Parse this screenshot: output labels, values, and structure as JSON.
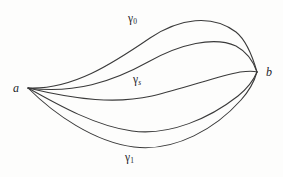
{
  "figure": {
    "kind": "homotopy-of-paths-diagram",
    "width": 283,
    "height": 177,
    "background_color": "#fdfdfc",
    "stroke_color": "#3a3a3a",
    "text_color": "#24242a"
  },
  "vertices": [
    {
      "id": "a",
      "label": "a",
      "x": 28,
      "y": 88
    },
    {
      "id": "b",
      "label": "b",
      "x": 257,
      "y": 72
    }
  ],
  "curve_labels": [
    {
      "id": "gamma-0",
      "symbol": "γ",
      "subscript": "0",
      "subscript_italic": false,
      "x": 128,
      "y": 13
    },
    {
      "id": "gamma-s",
      "symbol": "γ",
      "subscript": "s",
      "subscript_italic": true,
      "x": 133,
      "y": 74
    },
    {
      "id": "gamma-1",
      "symbol": "γ",
      "subscript": "1",
      "subscript_italic": false,
      "x": 125,
      "y": 152
    }
  ],
  "curves": [
    {
      "id": "curve-gamma-0",
      "name": "gamma-0",
      "path": "M 28 88 C 72 90 112 64 150 38 C 180 18 212 14 236 32 C 246 40 253 58 257 72"
    },
    {
      "id": "curve-gamma-upper-mid",
      "name": "gamma-upper-intermediate",
      "path": "M 28 88 C 74 94 112 82 148 62 C 180 44 214 36 236 46 C 247 52 254 63 257 72"
    },
    {
      "id": "curve-gamma-s",
      "name": "gamma-s",
      "path": "M 28 88 C 78 100 116 104 152 96 C 186 88 218 76 240 72 C 248 71 254 71 257 72"
    },
    {
      "id": "curve-gamma-lower-mid",
      "name": "gamma-lower-intermediate",
      "path": "M 28 88 C 60 106 96 126 132 131 C 170 136 210 118 238 96 C 248 88 254 79 257 72"
    },
    {
      "id": "curve-gamma-1",
      "name": "gamma-1",
      "path": "M 28 88 C 54 114 94 142 134 147 C 176 152 216 128 241 100 C 250 90 255 79 257 72"
    }
  ]
}
